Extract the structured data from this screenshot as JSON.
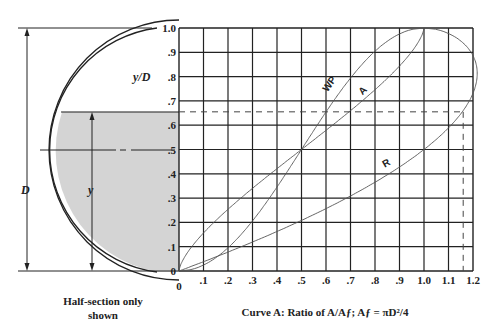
{
  "figure": {
    "left_panel": {
      "caption_line1": "Half-section only",
      "caption_line2": "shown",
      "label_D": "D",
      "label_y": "y",
      "label_yD": "y/D",
      "shaded_depth_yD": 0.655,
      "shade_color": "#d4d4d4"
    },
    "caption": "Curve A: Ratio of A/Aƒ; Aƒ = πD²/4",
    "curve_labels": {
      "wp": "WP",
      "a": "A",
      "r": "R"
    },
    "origin_label": "0"
  },
  "chart_data": {
    "type": "line",
    "title": "",
    "xlabel": "Curve A: Ratio of A/Af; Af = πD²/4",
    "ylabel": "y/D",
    "xlim": [
      0,
      1.2
    ],
    "ylim": [
      0,
      1.0
    ],
    "grid": true,
    "x_ticks": [
      ".1",
      ".2",
      ".3",
      ".4",
      ".5",
      ".6",
      ".7",
      ".8",
      ".9",
      "1.0",
      "1.1",
      "1.2"
    ],
    "y_ticks": [
      "0",
      ".1",
      ".2",
      ".3",
      ".4",
      ".5",
      ".6",
      ".7",
      ".8",
      ".9",
      "1.0"
    ],
    "series": [
      {
        "name": "A",
        "y": [
          0,
          0.1,
          0.2,
          0.3,
          0.4,
          0.5,
          0.6,
          0.7,
          0.8,
          0.9,
          1.0
        ],
        "x": [
          0,
          0.052,
          0.142,
          0.252,
          0.374,
          0.5,
          0.626,
          0.748,
          0.858,
          0.948,
          1.0
        ]
      },
      {
        "name": "WP",
        "y": [
          0,
          0.1,
          0.2,
          0.3,
          0.4,
          0.5,
          0.6,
          0.7,
          0.8,
          0.9,
          1.0
        ],
        "x": [
          0,
          0.205,
          0.295,
          0.369,
          0.436,
          0.5,
          0.564,
          0.631,
          0.705,
          0.795,
          1.0
        ]
      },
      {
        "name": "R",
        "y": [
          0,
          0.1,
          0.2,
          0.3,
          0.4,
          0.5,
          0.6,
          0.7,
          0.8,
          0.9,
          1.0
        ],
        "x": [
          0,
          0.254,
          0.482,
          0.684,
          0.857,
          1.0,
          1.11,
          1.185,
          1.217,
          1.192,
          1.0
        ]
      }
    ],
    "annotations": [
      {
        "type": "dashed-horizontal",
        "y": 0.655,
        "x_end": 1.16
      },
      {
        "type": "dashed-vertical",
        "x": 1.16,
        "y_end": 0.655
      }
    ]
  }
}
